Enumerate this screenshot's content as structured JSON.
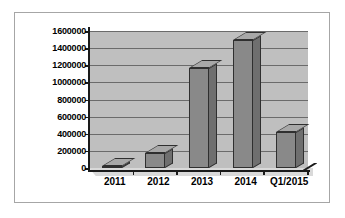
{
  "chart_data": {
    "type": "bar",
    "title": "",
    "subtitle": "",
    "xlabel": "",
    "ylabel": "",
    "categories": [
      "2011",
      "2012",
      "2013",
      "2014",
      "Q1/2015"
    ],
    "values": [
      20000,
      180000,
      1170000,
      1490000,
      420000
    ],
    "ylim": [
      0,
      1600000
    ],
    "y_ticks": [
      0,
      200000,
      400000,
      600000,
      800000,
      1000000,
      1200000,
      1400000,
      1600000
    ],
    "y_tick_labels": [
      "0",
      "200000",
      "400000",
      "600000",
      "800000",
      "1000000",
      "1200000",
      "1400000",
      "1600000"
    ],
    "grid": true,
    "legend": false,
    "legend_position": "none",
    "series": [
      {
        "name": "",
        "values": [
          20000,
          180000,
          1170000,
          1490000,
          420000
        ]
      }
    ],
    "style": {
      "bar_front_color": "#898989",
      "bar_side_color": "#6f6f6f",
      "bar_top_color": "#a8a8a8",
      "plot_background_color": "#bfbfbf",
      "floor_color": "#d9d9d9",
      "gridline_color": "#6b6b6b",
      "axis_color": "#1a1a1a",
      "frame_border_color": "#a6a6a6",
      "page_background_color": "#ffffff",
      "three_d": true
    }
  }
}
